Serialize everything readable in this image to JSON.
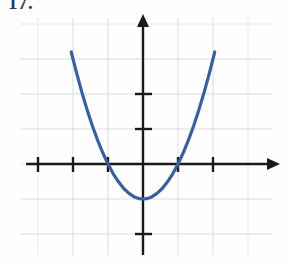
{
  "figure": {
    "label": "17.",
    "label_color": "#2e3a63"
  },
  "chart_data": {
    "type": "line",
    "title": "",
    "subtitle": "",
    "xlabel": "",
    "ylabel": "",
    "equation": "y = x^2 - 1",
    "curve_color": "#3a5f9e",
    "axis_color": "#1a1a1a",
    "grid_color": "#dcdcdc",
    "grid": true,
    "legend": "none",
    "xlim": [
      -3.6,
      3.6
    ],
    "ylim": [
      -2.9,
      4.2
    ],
    "x_ticks": [
      -3,
      -2,
      -1,
      1,
      2
    ],
    "y_ticks": [
      1,
      2,
      -2
    ],
    "x_tick_labels": [
      "",
      "",
      "",
      "",
      ""
    ],
    "y_tick_labels": [
      "",
      "",
      ""
    ],
    "grid_spacing_units": 1,
    "vertex": [
      0,
      -1
    ],
    "roots": [
      -1,
      1
    ],
    "y_intercept": -1,
    "series": [
      {
        "name": "parabola",
        "x": [
          -2.05,
          -1.9,
          -1.75,
          -1.6,
          -1.45,
          -1.3,
          -1.15,
          -1.0,
          -0.85,
          -0.7,
          -0.55,
          -0.4,
          -0.25,
          -0.1,
          0.0,
          0.1,
          0.25,
          0.4,
          0.55,
          0.7,
          0.85,
          1.0,
          1.15,
          1.3,
          1.45,
          1.6,
          1.75,
          1.9,
          2.05
        ],
        "y": [
          3.2,
          2.61,
          2.06,
          1.56,
          1.1,
          0.69,
          0.32,
          0.0,
          -0.28,
          -0.51,
          -0.7,
          -0.84,
          -0.94,
          -0.99,
          -1.0,
          -0.99,
          -0.94,
          -0.84,
          -0.7,
          -0.51,
          -0.28,
          0.0,
          0.32,
          0.69,
          1.1,
          1.56,
          2.06,
          2.61,
          3.2
        ]
      }
    ]
  },
  "geometry": {
    "origin_x": 143,
    "origin_y": 164,
    "unit_px": 35
  }
}
